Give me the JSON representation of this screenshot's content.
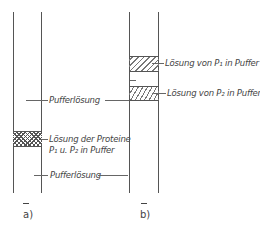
{
  "figure": {
    "tube_a": {
      "caption": "a)",
      "upper_label": "Pufferlösung",
      "band_label_line1": "Lösung der Proteine",
      "band_label_line2": "P₁ u. P₂ in Puffer",
      "lower_label": "Pufferlösung",
      "band_pattern": "crosshatch"
    },
    "tube_b": {
      "caption": "b)",
      "band1_label": "Lösung von P₁ in Puffer",
      "band2_label": "Lösung von P₂ in Puffer",
      "band1_pattern": "diagonal-hatch",
      "band2_pattern": "diagonal-hatch"
    },
    "colors": {
      "line": "#555555",
      "text": "#444444",
      "background": "#ffffff"
    }
  }
}
